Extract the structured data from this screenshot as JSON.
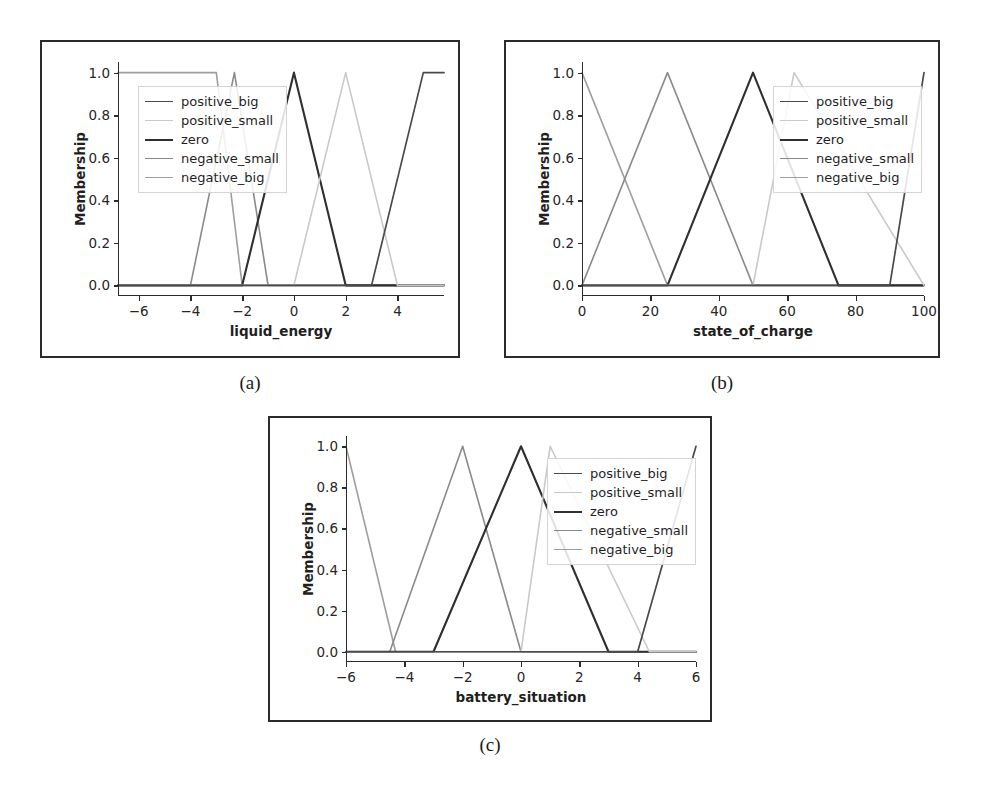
{
  "figure": {
    "caption_a": "(a)",
    "caption_b": "(b)",
    "caption_c": "(c)"
  },
  "series_names": {
    "positive_big": "positive_big",
    "positive_small": "positive_small",
    "zero": "zero",
    "negative_small": "negative_small",
    "negative_big": "negative_big"
  },
  "colors": {
    "positive_big": "#4a4a4a",
    "positive_small": "#c9c9c9",
    "zero": "#2f2f2f",
    "negative_small": "#8a8a8a",
    "negative_big": "#9e9e9e",
    "axis": "#2b2b2b",
    "frame": "#2b2b2b",
    "background": "#ffffff"
  },
  "chart_data": [
    {
      "id": "a",
      "type": "line",
      "title": "",
      "xlabel": "liquid_energy",
      "ylabel": "Membership",
      "xlim": [
        -6.8,
        5.8
      ],
      "ylim": [
        -0.05,
        1.05
      ],
      "grid": false,
      "legend_position": "upper left",
      "xticks": [
        -6,
        -4,
        -2,
        0,
        2,
        4
      ],
      "xtick_labels": [
        "−6",
        "−4",
        "−2",
        "0",
        "2",
        "4"
      ],
      "yticks": [
        0.0,
        0.2,
        0.4,
        0.6,
        0.8,
        1.0
      ],
      "ytick_labels": [
        "0.0",
        "0.2",
        "0.4",
        "0.6",
        "0.8",
        "1.0"
      ],
      "series": [
        {
          "name": "negative_big",
          "x": [
            -6.8,
            -3.0,
            -2.0,
            5.8
          ],
          "values": [
            1.0,
            1.0,
            0.0,
            0.0
          ]
        },
        {
          "name": "negative_small",
          "x": [
            -6.8,
            -4.0,
            -2.3,
            -1.0,
            5.8
          ],
          "values": [
            0.0,
            0.0,
            1.0,
            0.0,
            0.0
          ]
        },
        {
          "name": "zero",
          "x": [
            -6.8,
            -2.0,
            0.0,
            2.0,
            5.8
          ],
          "values": [
            0.0,
            0.0,
            1.0,
            0.0,
            0.0
          ]
        },
        {
          "name": "positive_small",
          "x": [
            -6.8,
            0.0,
            2.0,
            4.0,
            5.8
          ],
          "values": [
            0.0,
            0.0,
            1.0,
            0.0,
            0.0
          ]
        },
        {
          "name": "positive_big",
          "x": [
            -6.8,
            3.0,
            5.0,
            5.8
          ],
          "values": [
            0.0,
            0.0,
            1.0,
            1.0
          ]
        }
      ]
    },
    {
      "id": "b",
      "type": "line",
      "title": "",
      "xlabel": "state_of_charge",
      "ylabel": "Membership",
      "xlim": [
        0,
        100
      ],
      "ylim": [
        -0.05,
        1.05
      ],
      "grid": false,
      "legend_position": "upper right",
      "xticks": [
        0,
        20,
        40,
        60,
        80,
        100
      ],
      "xtick_labels": [
        "0",
        "20",
        "40",
        "60",
        "80",
        "100"
      ],
      "yticks": [
        0.0,
        0.2,
        0.4,
        0.6,
        0.8,
        1.0
      ],
      "ytick_labels": [
        "0.0",
        "0.2",
        "0.4",
        "0.6",
        "0.8",
        "1.0"
      ],
      "series": [
        {
          "name": "negative_big",
          "x": [
            0,
            25,
            100
          ],
          "values": [
            1.0,
            0.0,
            0.0
          ]
        },
        {
          "name": "negative_small",
          "x": [
            0,
            25,
            50,
            100
          ],
          "values": [
            0.0,
            1.0,
            0.0,
            0.0
          ]
        },
        {
          "name": "zero",
          "x": [
            0,
            25,
            50,
            75,
            100
          ],
          "values": [
            0.0,
            0.0,
            1.0,
            0.0,
            0.0
          ]
        },
        {
          "name": "positive_small",
          "x": [
            0,
            50,
            62,
            100
          ],
          "values": [
            0.0,
            0.0,
            1.0,
            0.0
          ]
        },
        {
          "name": "positive_big",
          "x": [
            0,
            90,
            100
          ],
          "values": [
            0.0,
            0.0,
            1.0
          ]
        }
      ]
    },
    {
      "id": "c",
      "type": "line",
      "title": "",
      "xlabel": "battery_situation",
      "ylabel": "Membership",
      "xlim": [
        -6,
        6
      ],
      "ylim": [
        -0.05,
        1.05
      ],
      "grid": false,
      "legend_position": "upper right",
      "xticks": [
        -6,
        -4,
        -2,
        0,
        2,
        4,
        6
      ],
      "xtick_labels": [
        "−6",
        "−4",
        "−2",
        "0",
        "2",
        "4",
        "6"
      ],
      "yticks": [
        0.0,
        0.2,
        0.4,
        0.6,
        0.8,
        1.0
      ],
      "ytick_labels": [
        "0.0",
        "0.2",
        "0.4",
        "0.6",
        "0.8",
        "1.0"
      ],
      "series": [
        {
          "name": "negative_big",
          "x": [
            -6.0,
            -4.3,
            6.0
          ],
          "values": [
            1.0,
            0.0,
            0.0
          ]
        },
        {
          "name": "negative_small",
          "x": [
            -6.0,
            -4.5,
            -2.0,
            0.0,
            6.0
          ],
          "values": [
            0.0,
            0.0,
            1.0,
            0.0,
            0.0
          ]
        },
        {
          "name": "zero",
          "x": [
            -6.0,
            -3.0,
            0.0,
            3.0,
            6.0
          ],
          "values": [
            0.0,
            0.0,
            1.0,
            0.0,
            0.0
          ]
        },
        {
          "name": "positive_small",
          "x": [
            -6.0,
            0.0,
            1.0,
            4.4,
            6.0
          ],
          "values": [
            0.0,
            0.0,
            1.0,
            0.0,
            0.0
          ]
        },
        {
          "name": "positive_big",
          "x": [
            -6.0,
            4.0,
            6.0
          ],
          "values": [
            0.0,
            0.0,
            1.0
          ]
        }
      ]
    }
  ]
}
